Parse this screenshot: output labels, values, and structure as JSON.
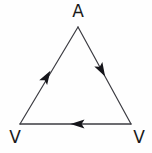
{
  "figure": {
    "kind": "directed-triangle-cycle-diagram",
    "width": 152,
    "height": 153,
    "background_color": "#fefefe",
    "stroke_color": "#3c3c42",
    "text_color": "#1a1a1a",
    "stroke_width": 1.2
  },
  "nodes": [
    {
      "id": "apex",
      "label": "A",
      "x": 78,
      "y": 27,
      "label_x": 78,
      "label_y": 12
    },
    {
      "id": "bottom_left",
      "label": "V",
      "x": 20,
      "y": 124,
      "label_x": 15,
      "label_y": 138
    },
    {
      "id": "bottom_right",
      "label": "V",
      "x": 131,
      "y": 124,
      "label_x": 139,
      "label_y": 138
    }
  ],
  "edges": [
    {
      "id": "edge-left",
      "from": "bottom_left",
      "to": "apex",
      "direction": "up-right",
      "arrow_x": 46,
      "arrow_y": 78,
      "arrow_angle_deg": -59
    },
    {
      "id": "edge-right",
      "from": "apex",
      "to": "bottom_right",
      "direction": "down-right",
      "arrow_x": 101,
      "arrow_y": 69,
      "arrow_angle_deg": 60
    },
    {
      "id": "edge-bottom",
      "from": "bottom_right",
      "to": "bottom_left",
      "direction": "left",
      "arrow_x": 79,
      "arrow_y": 124,
      "arrow_angle_deg": 180
    }
  ],
  "labels": {
    "apex": "A",
    "bottom_left": "V",
    "bottom_right": "V"
  }
}
